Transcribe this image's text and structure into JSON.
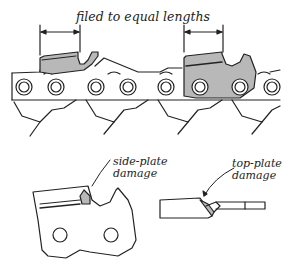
{
  "diagram": {
    "colors": {
      "outline": "#222222",
      "cutter_fill": "#b8b8b8",
      "background": "#ffffff",
      "rivet_fill": "#ffffff"
    },
    "chain": {
      "dimension_label": "filed to equal lengths",
      "cutters": [
        {
          "name": "left-cutter",
          "shaded": true
        },
        {
          "name": "right-cutter",
          "shaded": true
        }
      ],
      "rivet_count": 8
    },
    "details": [
      {
        "id": "side-plate",
        "line1": "side-plate",
        "line2": "damage"
      },
      {
        "id": "top-plate",
        "line1": "top-plate",
        "line2": "damage"
      }
    ]
  }
}
